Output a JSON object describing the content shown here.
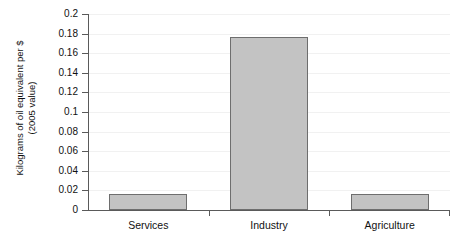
{
  "chart_data": {
    "type": "bar",
    "title": "",
    "xlabel": "",
    "ylabel_line1": "Kilograms of oil equivalent per $",
    "ylabel_line2": "(2005 value)",
    "categories": [
      "Services",
      "Industry",
      "Agriculture"
    ],
    "values": [
      0.0165,
      0.177,
      0.016
    ],
    "ylim": [
      0,
      0.2
    ],
    "ytick_labels": [
      "0",
      "0.02",
      "0.04",
      "0.06",
      "0.08",
      "0.1",
      "0.12",
      "0.14",
      "0.16",
      "0.18",
      "0.2"
    ],
    "ytick_values": [
      0,
      0.02,
      0.04,
      0.06,
      0.08,
      0.1,
      0.12,
      0.14,
      0.16,
      0.18,
      0.2
    ],
    "grid": true,
    "legend": "none",
    "bar_fill_color": "#c3c3c3",
    "bar_border_color": "#6e6e6e",
    "axis_color": "#5a5a5a",
    "gridline_color": "#f1f1f1",
    "background_color": "#ffffff"
  }
}
